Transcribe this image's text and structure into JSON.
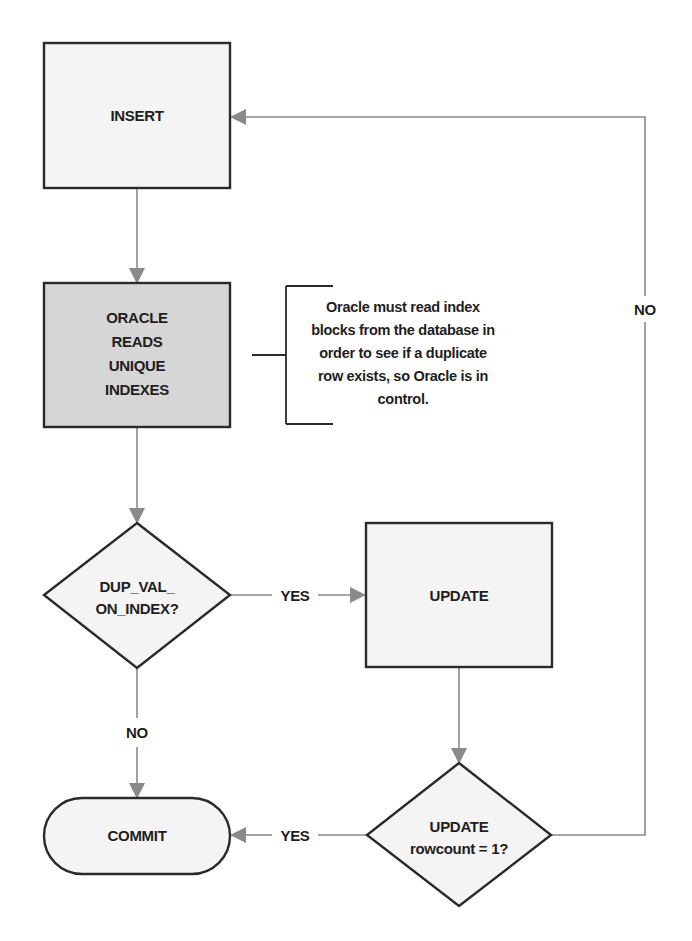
{
  "diagram": {
    "type": "flowchart",
    "colors": {
      "process_fill": "#f4f4f4",
      "highlight_fill": "#d6d6d6",
      "decision_fill": "#f4f4f4",
      "terminal_fill": "#f4f4f4",
      "border": "#2a2a2a",
      "connector": "#8a8a8a",
      "text": "#1e1e1e"
    },
    "nodes": {
      "insert": {
        "shape": "rectangle",
        "lines": [
          "INSERT"
        ]
      },
      "oracle_reads": {
        "shape": "rectangle",
        "highlighted": true,
        "lines": [
          "ORACLE",
          "READS",
          "UNIQUE",
          "INDEXES"
        ]
      },
      "dup_val_check": {
        "shape": "diamond",
        "lines": [
          "DUP_VAL_",
          "ON_INDEX?"
        ]
      },
      "update": {
        "shape": "rectangle",
        "lines": [
          "UPDATE"
        ]
      },
      "rowcount_check": {
        "shape": "diamond",
        "lines": [
          "UPDATE",
          "rowcount = 1?"
        ]
      },
      "commit": {
        "shape": "terminal",
        "lines": [
          "COMMIT"
        ]
      }
    },
    "annotation": {
      "attached_to": "oracle_reads",
      "lines": [
        "Oracle must read index",
        "blocks from the database in",
        "order to see if a duplicate",
        "row exists, so Oracle is in",
        "control."
      ]
    },
    "edges": [
      {
        "from": "insert",
        "to": "oracle_reads",
        "label": ""
      },
      {
        "from": "oracle_reads",
        "to": "dup_val_check",
        "label": ""
      },
      {
        "from": "dup_val_check",
        "to": "update",
        "label": "YES"
      },
      {
        "from": "dup_val_check",
        "to": "commit",
        "label": "NO"
      },
      {
        "from": "update",
        "to": "rowcount_check",
        "label": ""
      },
      {
        "from": "rowcount_check",
        "to": "commit",
        "label": "YES"
      },
      {
        "from": "rowcount_check",
        "to": "insert",
        "label": "NO"
      }
    ]
  }
}
